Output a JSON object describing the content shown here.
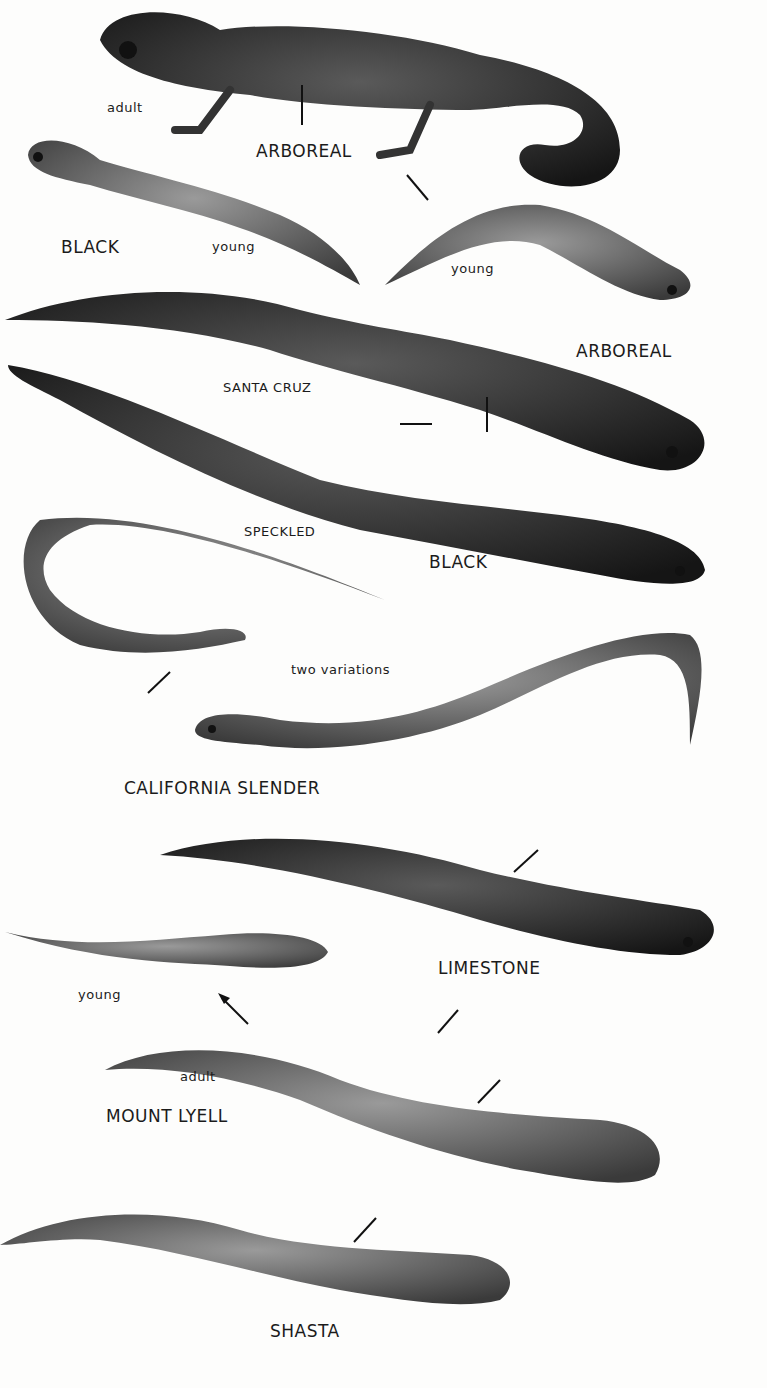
{
  "plate": {
    "subject": "Western salamanders illustration plate",
    "labels": [
      {
        "id": "adult-1",
        "text": "adult"
      },
      {
        "id": "arboreal-1",
        "text": "ARBOREAL"
      },
      {
        "id": "black-1",
        "text": "BLACK"
      },
      {
        "id": "young-1",
        "text": "young"
      },
      {
        "id": "young-2",
        "text": "young"
      },
      {
        "id": "arboreal-2",
        "text": "ARBOREAL"
      },
      {
        "id": "santa-cruz",
        "text": "SANTA CRUZ"
      },
      {
        "id": "speckled",
        "text": "SPECKLED"
      },
      {
        "id": "black-2",
        "text": "BLACK"
      },
      {
        "id": "two-variations",
        "text": "two variations"
      },
      {
        "id": "california-slender",
        "text": "CALIFORNIA SLENDER"
      },
      {
        "id": "limestone",
        "text": "LIMESTONE"
      },
      {
        "id": "young-3",
        "text": "young"
      },
      {
        "id": "adult-2",
        "text": "adult"
      },
      {
        "id": "mount-lyell",
        "text": "MOUNT LYELL"
      },
      {
        "id": "shasta",
        "text": "SHASTA"
      }
    ],
    "colors": {
      "ink": "#1b1b1b",
      "body_dark": "#2a2a2a",
      "body_mid": "#6a6a6a",
      "paper": "#fdfdfc"
    }
  }
}
